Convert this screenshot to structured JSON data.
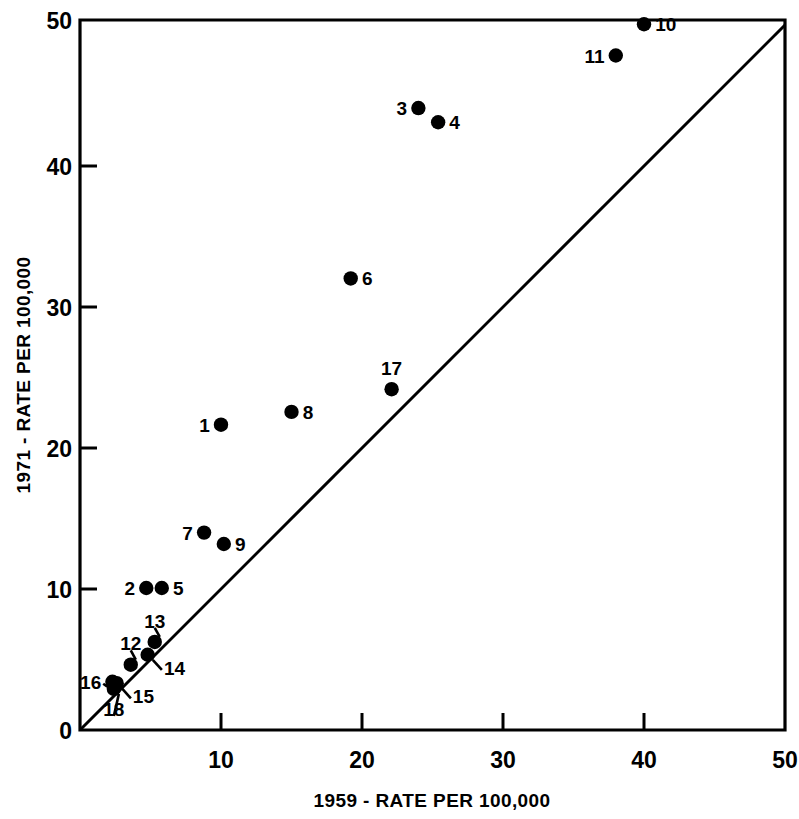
{
  "chart_data": {
    "type": "scatter",
    "title": "",
    "xlabel": "1959 - RATE PER 100,000",
    "ylabel": "1971 - RATE PER 100,000",
    "xlim": [
      0,
      50
    ],
    "ylim": [
      0,
      50
    ],
    "xticks": [
      0,
      10,
      20,
      30,
      40,
      50
    ],
    "yticks": [
      0,
      10,
      20,
      30,
      40,
      50
    ],
    "xtick_labels": [
      "0",
      "10",
      "20",
      "30",
      "40",
      "50"
    ],
    "ytick_labels": [
      "0",
      "10",
      "20",
      "30",
      "40",
      "50"
    ],
    "grid": false,
    "legend": "none",
    "annotations": [
      {
        "text": "reference line y = x (45 degree diagonal)",
        "from": [
          0,
          0
        ],
        "to": [
          50,
          50
        ]
      }
    ],
    "points": [
      {
        "label": "1",
        "x": 10.0,
        "y": 21.5,
        "label_pos": "left"
      },
      {
        "label": "2",
        "x": 4.7,
        "y": 10.0,
        "label_pos": "left"
      },
      {
        "label": "3",
        "x": 24.0,
        "y": 43.8,
        "label_pos": "left"
      },
      {
        "label": "4",
        "x": 25.4,
        "y": 42.8,
        "label_pos": "right"
      },
      {
        "label": "5",
        "x": 5.8,
        "y": 10.0,
        "label_pos": "right"
      },
      {
        "label": "6",
        "x": 19.2,
        "y": 31.8,
        "label_pos": "right"
      },
      {
        "label": "7",
        "x": 8.8,
        "y": 13.9,
        "label_pos": "left"
      },
      {
        "label": "8",
        "x": 15.0,
        "y": 22.4,
        "label_pos": "right"
      },
      {
        "label": "9",
        "x": 10.2,
        "y": 13.1,
        "label_pos": "right"
      },
      {
        "label": "10",
        "x": 40.0,
        "y": 49.7,
        "label_pos": "right"
      },
      {
        "label": "11",
        "x": 38.0,
        "y": 47.5,
        "label_pos": "left"
      },
      {
        "label": "12",
        "x": 3.6,
        "y": 4.6,
        "label_pos": "above"
      },
      {
        "label": "13",
        "x": 5.3,
        "y": 6.2,
        "label_pos": "above"
      },
      {
        "label": "14",
        "x": 4.8,
        "y": 5.3,
        "label_pos": "below-right"
      },
      {
        "label": "15",
        "x": 2.6,
        "y": 3.3,
        "label_pos": "below-right"
      },
      {
        "label": "16",
        "x": 2.3,
        "y": 3.4,
        "label_pos": "left"
      },
      {
        "label": "17",
        "x": 22.1,
        "y": 24.0,
        "label_pos": "above"
      },
      {
        "label": "18",
        "x": 2.4,
        "y": 2.9,
        "label_pos": "below"
      }
    ]
  },
  "axes": {
    "x_title": "1959 - RATE PER 100,000",
    "y_title": "1971 - RATE PER 100,000",
    "x_tick_0": "0",
    "x_tick_10": "10",
    "x_tick_20": "20",
    "x_tick_30": "30",
    "x_tick_40": "40",
    "x_tick_50": "50",
    "y_tick_0": "0",
    "y_tick_10": "10",
    "y_tick_20": "20",
    "y_tick_30": "30",
    "y_tick_40": "40",
    "y_tick_50": "50"
  },
  "point_labels": {
    "p1": "1",
    "p2": "2",
    "p3": "3",
    "p4": "4",
    "p5": "5",
    "p6": "6",
    "p7": "7",
    "p8": "8",
    "p9": "9",
    "p10": "10",
    "p11": "11",
    "p12": "12",
    "p13": "13",
    "p14": "14",
    "p15": "15",
    "p16": "16",
    "p17": "17",
    "p18": "18"
  },
  "colors": {
    "ink": "#000000",
    "background": "#ffffff"
  }
}
